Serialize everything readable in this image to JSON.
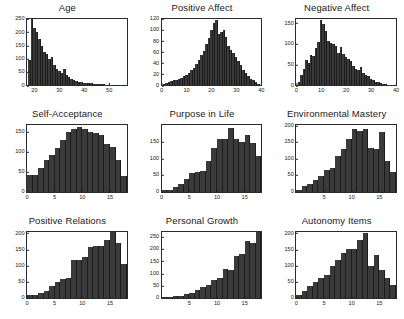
{
  "figure": {
    "layout": "3x3 grid of histograms",
    "bar_color": "#3a3a3a",
    "axis_color": "#2b2b2b",
    "background": "#ffffff"
  },
  "chart_data": [
    {
      "type": "bar",
      "title": "Age",
      "xlabel": "",
      "ylabel": "",
      "grid": false,
      "legend": "none",
      "xlim": [
        17,
        57
      ],
      "ylim": [
        0,
        250
      ],
      "xticks": [
        20,
        30,
        40,
        50
      ],
      "yticks": [
        0,
        50,
        100,
        150,
        200,
        250
      ],
      "bin_centers": [
        18,
        19,
        20,
        21,
        22,
        23,
        24,
        25,
        26,
        27,
        28,
        29,
        30,
        31,
        32,
        33,
        34,
        35,
        36,
        37,
        38,
        39,
        40,
        41,
        42,
        43,
        44,
        45,
        46,
        47,
        48,
        49,
        50,
        51,
        52,
        53,
        54,
        55
      ],
      "values": [
        95,
        255,
        215,
        200,
        175,
        150,
        125,
        118,
        100,
        105,
        75,
        62,
        55,
        45,
        62,
        40,
        30,
        24,
        20,
        18,
        14,
        12,
        10,
        9,
        8,
        7,
        6,
        6,
        5,
        4,
        4,
        3,
        3,
        3,
        2,
        2,
        2,
        1
      ]
    },
    {
      "type": "bar",
      "title": "Positive Affect",
      "xlabel": "",
      "ylabel": "",
      "grid": false,
      "legend": "none",
      "xlim": [
        0,
        40
      ],
      "ylim": [
        0,
        120
      ],
      "xticks": [
        0,
        10,
        20,
        30,
        40
      ],
      "yticks": [
        0,
        20,
        40,
        60,
        80,
        100,
        120
      ],
      "bin_centers": [
        1,
        2,
        3,
        4,
        5,
        6,
        7,
        8,
        9,
        10,
        11,
        12,
        13,
        14,
        15,
        16,
        17,
        18,
        19,
        20,
        21,
        22,
        23,
        24,
        25,
        26,
        27,
        28,
        29,
        30,
        31,
        32,
        33,
        34,
        35,
        36,
        37,
        38,
        39
      ],
      "values": [
        3,
        4,
        6,
        7,
        10,
        9,
        12,
        13,
        16,
        19,
        22,
        28,
        32,
        38,
        46,
        55,
        62,
        74,
        86,
        100,
        112,
        118,
        92,
        96,
        100,
        88,
        72,
        64,
        58,
        52,
        44,
        36,
        28,
        22,
        16,
        12,
        9,
        6,
        3
      ]
    },
    {
      "type": "bar",
      "title": "Negative Affect",
      "xlabel": "",
      "ylabel": "",
      "grid": false,
      "legend": "none",
      "xlim": [
        0,
        40
      ],
      "ylim": [
        0,
        160
      ],
      "xticks": [
        0,
        10,
        20,
        30,
        40
      ],
      "yticks": [
        0,
        50,
        100,
        150
      ],
      "bin_centers": [
        1,
        2,
        3,
        4,
        5,
        6,
        7,
        8,
        9,
        10,
        11,
        12,
        13,
        14,
        15,
        16,
        17,
        18,
        19,
        20,
        21,
        22,
        23,
        24,
        25,
        26,
        27,
        28,
        29,
        30,
        31,
        32,
        33,
        34,
        35,
        36,
        37,
        38,
        39
      ],
      "values": [
        8,
        25,
        40,
        60,
        55,
        72,
        70,
        90,
        105,
        158,
        148,
        130,
        108,
        102,
        100,
        96,
        78,
        92,
        76,
        68,
        64,
        58,
        46,
        40,
        36,
        44,
        30,
        26,
        22,
        16,
        12,
        9,
        7,
        5,
        4,
        3,
        2,
        2,
        1
      ]
    },
    {
      "type": "bar",
      "title": "Self-Acceptance",
      "xlabel": "",
      "ylabel": "",
      "grid": false,
      "legend": "none",
      "xlim": [
        0,
        18
      ],
      "ylim": [
        0,
        165
      ],
      "xticks": [
        0,
        5,
        10,
        15
      ],
      "yticks": [
        0,
        50,
        100,
        150
      ],
      "bin_centers": [
        0.5,
        1.5,
        2.5,
        3.5,
        4.5,
        5.5,
        6.5,
        7.5,
        8.5,
        9.5,
        10.5,
        11.5,
        12.5,
        13.5,
        14.5,
        15.5,
        16.5,
        17.5
      ],
      "values": [
        42,
        42,
        60,
        80,
        92,
        108,
        128,
        148,
        155,
        162,
        155,
        148,
        145,
        140,
        118,
        112,
        78,
        40
      ]
    },
    {
      "type": "bar",
      "title": "Purpose in Life",
      "xlabel": "",
      "ylabel": "",
      "grid": false,
      "legend": "none",
      "xlim": [
        0,
        18
      ],
      "ylim": [
        0,
        200
      ],
      "xticks": [
        0,
        5,
        10,
        15
      ],
      "yticks": [
        0,
        50,
        100,
        150
      ],
      "bin_centers": [
        0.5,
        1.5,
        2.5,
        3.5,
        4.5,
        5.5,
        6.5,
        7.5,
        8.5,
        9.5,
        10.5,
        11.5,
        12.5,
        13.5,
        14.5,
        15.5,
        16.5,
        17.5
      ],
      "values": [
        4,
        6,
        14,
        24,
        38,
        56,
        60,
        62,
        92,
        132,
        160,
        160,
        192,
        160,
        150,
        172,
        148,
        108
      ]
    },
    {
      "type": "bar",
      "title": "Environmental Mastery",
      "xlabel": "",
      "ylabel": "",
      "grid": false,
      "legend": "none",
      "xlim": [
        0,
        18
      ],
      "ylim": [
        0,
        200
      ],
      "xticks": [
        5,
        10,
        15
      ],
      "yticks": [
        0,
        50,
        100,
        150,
        200
      ],
      "bin_centers": [
        0.5,
        1.5,
        2.5,
        3.5,
        4.5,
        5.5,
        6.5,
        7.5,
        8.5,
        9.5,
        10.5,
        11.5,
        12.5,
        13.5,
        14.5,
        15.5,
        16.5,
        17.5
      ],
      "values": [
        6,
        16,
        24,
        34,
        46,
        66,
        72,
        108,
        130,
        160,
        188,
        182,
        188,
        132,
        128,
        180,
        92,
        58
      ]
    },
    {
      "type": "bar",
      "title": "Positive Relations",
      "xlabel": "",
      "ylabel": "",
      "grid": false,
      "legend": "none",
      "xlim": [
        0,
        18
      ],
      "ylim": [
        0,
        205
      ],
      "xticks": [
        0,
        5,
        10,
        15
      ],
      "yticks": [
        0,
        50,
        100,
        150,
        200
      ],
      "bin_centers": [
        0.5,
        1.5,
        2.5,
        3.5,
        4.5,
        5.5,
        6.5,
        7.5,
        8.5,
        9.5,
        10.5,
        11.5,
        12.5,
        13.5,
        14.5,
        15.5,
        16.5,
        17.5
      ],
      "values": [
        10,
        8,
        14,
        22,
        36,
        50,
        58,
        62,
        118,
        118,
        128,
        158,
        160,
        160,
        180,
        205,
        170,
        106
      ]
    },
    {
      "type": "bar",
      "title": "Personal Growth",
      "xlabel": "",
      "ylabel": "",
      "grid": false,
      "legend": "none",
      "xlim": [
        0,
        18
      ],
      "ylim": [
        0,
        270
      ],
      "xticks": [
        5,
        10,
        15
      ],
      "yticks": [
        0,
        50,
        100,
        150,
        200,
        250
      ],
      "bin_centers": [
        0.5,
        1.5,
        2.5,
        3.5,
        4.5,
        5.5,
        6.5,
        7.5,
        8.5,
        9.5,
        10.5,
        11.5,
        12.5,
        13.5,
        14.5,
        15.5,
        16.5,
        17.5
      ],
      "values": [
        4,
        5,
        8,
        10,
        16,
        22,
        32,
        44,
        52,
        72,
        80,
        118,
        112,
        172,
        178,
        232,
        225,
        268
      ]
    },
    {
      "type": "bar",
      "title": "Autonomy Items",
      "xlabel": "",
      "ylabel": "",
      "grid": false,
      "legend": "none",
      "xlim": [
        0,
        18
      ],
      "ylim": [
        0,
        205
      ],
      "xticks": [
        0,
        5,
        10,
        15
      ],
      "yticks": [
        0,
        50,
        100,
        150,
        200
      ],
      "bin_centers": [
        0.5,
        1.5,
        2.5,
        3.5,
        4.5,
        5.5,
        6.5,
        7.5,
        8.5,
        9.5,
        10.5,
        11.5,
        12.5,
        13.5,
        14.5,
        15.5,
        16.5,
        17.5
      ],
      "values": [
        8,
        22,
        36,
        48,
        62,
        70,
        100,
        118,
        138,
        152,
        152,
        178,
        202,
        100,
        132,
        88,
        62,
        40
      ]
    }
  ]
}
